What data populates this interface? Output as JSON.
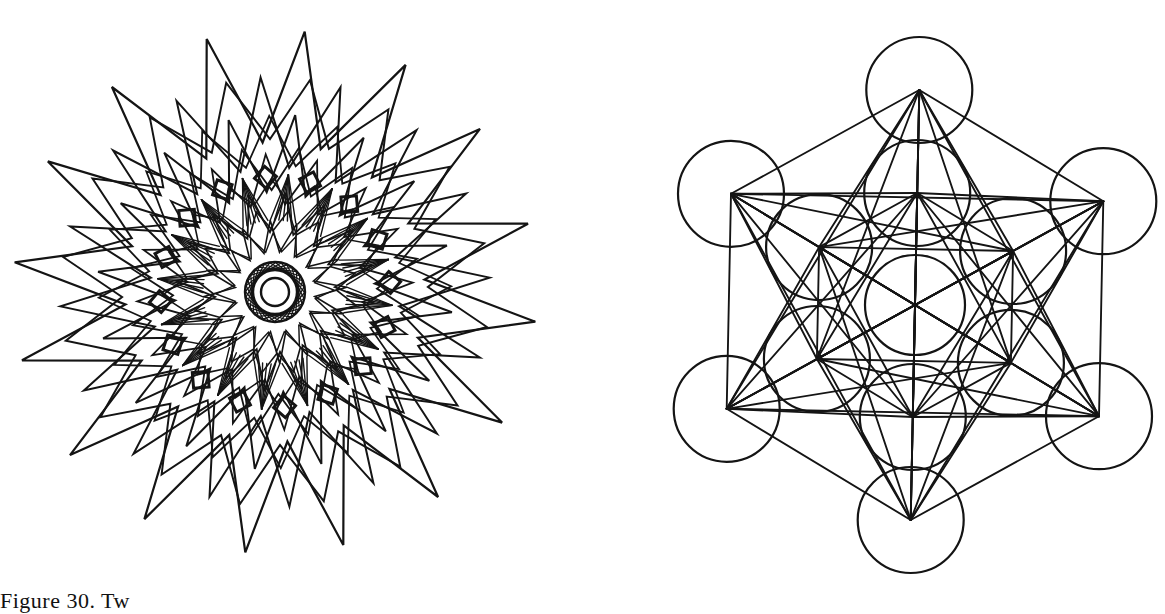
{
  "figure": {
    "caption": "Figure 30. Two geometric designs",
    "caption_visible": "Figure 30. Tw",
    "colors": {
      "ink": "#141414",
      "paper": "#ffffff"
    }
  },
  "left_figure": {
    "name": "layered star mandala",
    "center": [
      275,
      292
    ],
    "tips": 16,
    "rotation_deg": -106,
    "layers": [
      {
        "outer": 262,
        "inner": 150,
        "stroke": 2.2
      },
      {
        "outer": 215,
        "inner": 125,
        "stroke": 2.0,
        "offset_deg": 11.25
      },
      {
        "outer": 178,
        "inner": 100,
        "stroke": 2.0
      },
      {
        "outer": 138,
        "inner": 88,
        "stroke": 1.8,
        "offset_deg": 11.25
      },
      {
        "outer": 100,
        "inner": 60,
        "stroke": 1.8
      },
      {
        "outer": 72,
        "inner": 40,
        "stroke": 1.6,
        "offset_deg": 11.25
      }
    ],
    "core": {
      "radius": 30,
      "spokes": 32,
      "rings": [
        30,
        22,
        14
      ]
    }
  },
  "right_figure": {
    "name": "Metatron's Cube",
    "center": [
      915,
      305
    ],
    "outer_radius": 215,
    "inner_radius": 112,
    "circle_radius": 53,
    "center_circle_radius": 50,
    "stroke": 2.2
  }
}
